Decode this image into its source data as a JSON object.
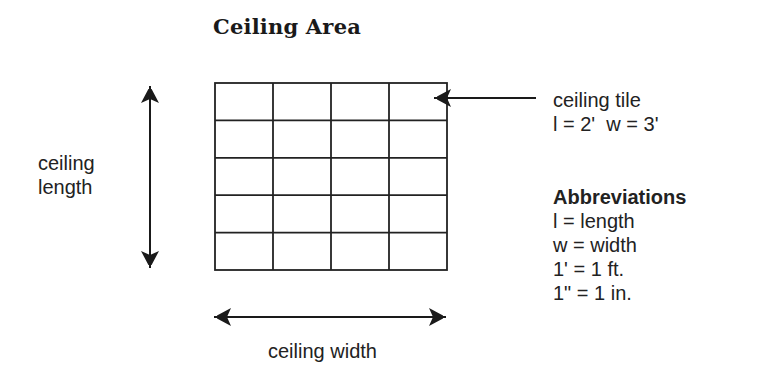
{
  "title": "Ceiling Area",
  "grid": {
    "columns": 4,
    "rows": 5,
    "x": 215,
    "y": 83,
    "width": 232,
    "height": 187,
    "stroke": "#222222"
  },
  "labels": {
    "length_line1": "ceiling",
    "length_line2": "length",
    "width": "ceiling width"
  },
  "callout": {
    "line1": "ceiling tile",
    "line2": "l = 2'  w = 3'"
  },
  "abbreviations": {
    "heading": "Abbreviations",
    "items": [
      "l = length",
      "w = width",
      "1' = 1 ft.",
      "1\" = 1 in."
    ]
  }
}
